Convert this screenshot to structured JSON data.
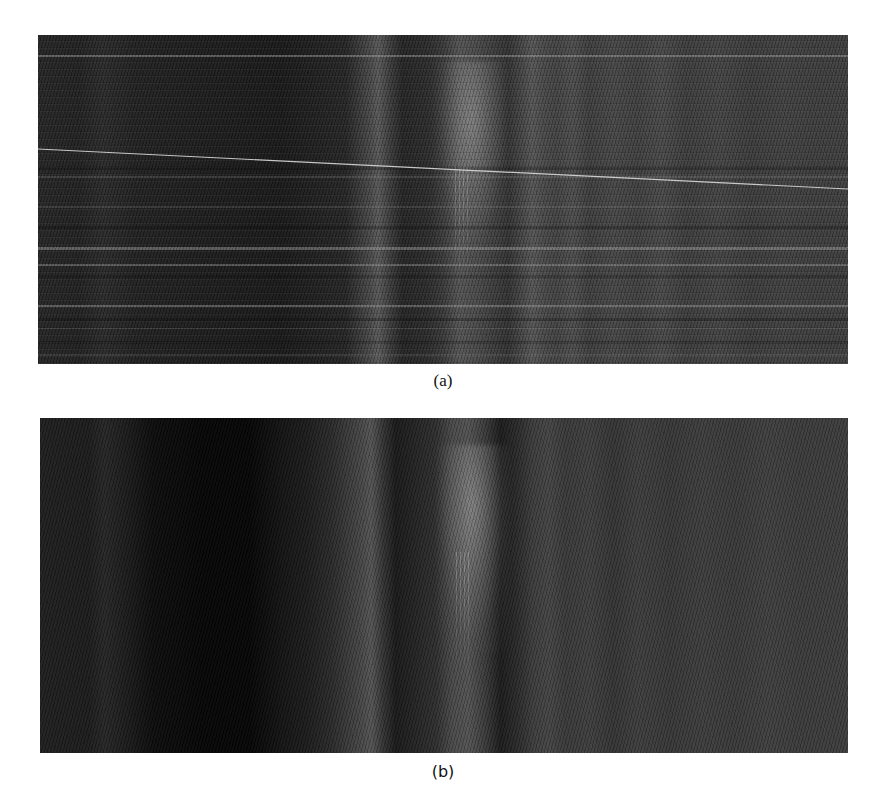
{
  "figure": {
    "panels": [
      {
        "id": "a",
        "caption": "(a)",
        "description": "Grayscale B-scan image with horizontal stripe artifacts and a diagonal bright line",
        "has_horizontal_stripes": true,
        "has_diagonal_line": true,
        "diagonal_line": {
          "x1": 0,
          "y1": 114,
          "x2": 810,
          "y2": 154,
          "color": "#d8d8d8"
        }
      },
      {
        "id": "b",
        "caption": "(b)",
        "description": "Grayscale B-scan image after stripe removal",
        "has_horizontal_stripes": false,
        "has_diagonal_line": false
      }
    ],
    "colors": {
      "background": "#ffffff",
      "image_dark": "#1a1a1a",
      "image_mid": "#404040",
      "reflection_bright": "#a8a8a8",
      "caption_text": "#111111"
    }
  }
}
